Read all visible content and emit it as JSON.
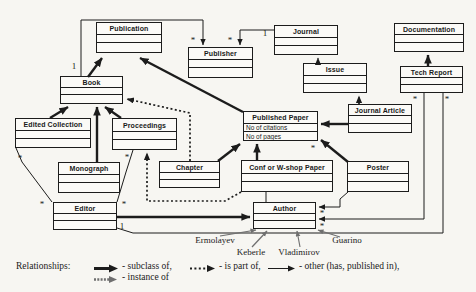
{
  "figure": {
    "colors": {
      "line": "#1c1c1c",
      "instance_line": "#6f6f6f",
      "background": "#f7f6f2",
      "box_fill": "#fbfaf7"
    },
    "nodes": [
      {
        "id": "publication",
        "label": "Publication",
        "x": 96,
        "y": 22,
        "w": 66,
        "h": 31,
        "attrs": [
          "",
          ""
        ]
      },
      {
        "id": "publisher",
        "label": "Publisher",
        "x": 188,
        "y": 47,
        "w": 65,
        "h": 31,
        "attrs": [
          "",
          ""
        ]
      },
      {
        "id": "journal",
        "label": "Journal",
        "x": 274,
        "y": 25,
        "w": 64,
        "h": 30,
        "attrs": [
          "",
          ""
        ]
      },
      {
        "id": "documentation",
        "label": "Documentation",
        "x": 394,
        "y": 23,
        "w": 70,
        "h": 29,
        "attrs": [
          "",
          ""
        ]
      },
      {
        "id": "book",
        "label": "Book",
        "x": 60,
        "y": 76,
        "w": 63,
        "h": 28,
        "attrs": [
          "",
          ""
        ]
      },
      {
        "id": "issue",
        "label": "Issue",
        "x": 303,
        "y": 63,
        "w": 64,
        "h": 30,
        "attrs": [
          "",
          ""
        ]
      },
      {
        "id": "tech-report",
        "label": "Tech Report",
        "x": 400,
        "y": 66,
        "w": 63,
        "h": 27,
        "attrs": [
          "",
          ""
        ]
      },
      {
        "id": "edited-collection",
        "label": "Edited Collection",
        "x": 15,
        "y": 118,
        "w": 76,
        "h": 30,
        "attrs": [
          "",
          ""
        ]
      },
      {
        "id": "proceedings",
        "label": "Proceedings",
        "x": 112,
        "y": 118,
        "w": 65,
        "h": 32,
        "attrs": [
          "",
          ""
        ]
      },
      {
        "id": "published-paper",
        "label": "Published Paper",
        "x": 243,
        "y": 111,
        "w": 75,
        "h": 30,
        "attrs": [
          "No of citations",
          "No of pages"
        ]
      },
      {
        "id": "journal-article",
        "label": "Journal Article",
        "x": 348,
        "y": 104,
        "w": 64,
        "h": 29,
        "attrs": [
          "",
          ""
        ]
      },
      {
        "id": "monograph",
        "label": "Monograph",
        "x": 58,
        "y": 162,
        "w": 62,
        "h": 31,
        "attrs": [
          "",
          ""
        ]
      },
      {
        "id": "chapter",
        "label": "Chapter",
        "x": 159,
        "y": 161,
        "w": 61,
        "h": 27,
        "attrs": [
          "",
          ""
        ]
      },
      {
        "id": "conf-paper",
        "label": "Conf or W-shop Paper",
        "x": 241,
        "y": 160,
        "w": 92,
        "h": 32,
        "attrs": [
          "",
          ""
        ]
      },
      {
        "id": "poster",
        "label": "Poster",
        "x": 347,
        "y": 161,
        "w": 62,
        "h": 31,
        "attrs": [
          "",
          ""
        ]
      },
      {
        "id": "editor",
        "label": "Editor",
        "x": 53,
        "y": 202,
        "w": 64,
        "h": 28,
        "attrs": [
          "",
          ""
        ]
      },
      {
        "id": "author",
        "label": "Author",
        "x": 253,
        "y": 202,
        "w": 63,
        "h": 27,
        "attrs": [
          "",
          ""
        ]
      }
    ],
    "edges": [
      {
        "name": "book-subclass-of-publication",
        "type": "subclass",
        "points": [
          [
            88,
            77
          ],
          [
            102,
            58
          ]
        ]
      },
      {
        "name": "published-paper-subclass-of-publication",
        "type": "subclass",
        "points": [
          [
            243,
            112
          ],
          [
            140,
            58
          ]
        ]
      },
      {
        "name": "edited-collection-subclass-of-book",
        "type": "subclass",
        "points": [
          [
            50,
            118
          ],
          [
            68,
            107
          ]
        ]
      },
      {
        "name": "proceedings-subclass-of-book",
        "type": "subclass",
        "points": [
          [
            121,
            118
          ],
          [
            105,
            107
          ]
        ]
      },
      {
        "name": "monograph-subclass-of-book",
        "type": "subclass",
        "points": [
          [
            97,
            162
          ],
          [
            97,
            107
          ]
        ]
      },
      {
        "name": "chapter-subclass-of-published-paper",
        "type": "subclass",
        "points": [
          [
            218,
            161
          ],
          [
            240,
            144
          ]
        ]
      },
      {
        "name": "conf-paper-subclass-of-published-paper",
        "type": "subclass",
        "points": [
          [
            257,
            160
          ],
          [
            257,
            144
          ]
        ]
      },
      {
        "name": "poster-subclass-of-published-paper",
        "type": "subclass",
        "points": [
          [
            348,
            162
          ],
          [
            321,
            140
          ]
        ]
      },
      {
        "name": "journal-article-subclass-of-published-paper",
        "type": "subclass",
        "points": [
          [
            348,
            124
          ],
          [
            321,
            124
          ]
        ]
      },
      {
        "name": "tech-report-subclass-of-documentation",
        "type": "subclass",
        "points": [
          [
            428,
            66
          ],
          [
            428,
            55
          ]
        ]
      },
      {
        "name": "editor-subclass-of-author",
        "type": "subclass",
        "points": [
          [
            117,
            217
          ],
          [
            250,
            217
          ]
        ]
      },
      {
        "name": "issue-part-of-journal",
        "type": "partof",
        "points": [
          [
            318,
            63
          ],
          [
            318,
            58
          ]
        ]
      },
      {
        "name": "journal-article-part-of-issue",
        "type": "partof",
        "points": [
          [
            359,
            104
          ],
          [
            359,
            96
          ]
        ]
      },
      {
        "name": "chapter-part-of-book",
        "type": "partof",
        "points": [
          [
            190,
            161
          ],
          [
            190,
            113
          ],
          [
            127,
            99
          ]
        ]
      },
      {
        "name": "conf-paper-part-of-proceedings",
        "type": "partof",
        "points": [
          [
            241,
            192
          ],
          [
            225,
            201
          ],
          [
            147,
            201
          ],
          [
            147,
            153
          ]
        ]
      },
      {
        "name": "book-publisher-association",
        "type": "other",
        "points": [
          [
            81,
            76
          ],
          [
            81,
            20
          ],
          [
            203,
            20
          ],
          [
            203,
            45
          ]
        ]
      },
      {
        "name": "journal-publisher-association",
        "type": "other",
        "points": [
          [
            274,
            30
          ],
          [
            240,
            30
          ],
          [
            240,
            45
          ]
        ]
      },
      {
        "name": "poster-author-association",
        "type": "other",
        "points": [
          [
            348,
            192
          ],
          [
            340,
            199
          ],
          [
            340,
            207
          ],
          [
            319,
            207
          ]
        ]
      },
      {
        "name": "tech-report-author-association",
        "type": "other",
        "points": [
          [
            424,
            93
          ],
          [
            424,
            219
          ],
          [
            319,
            219
          ]
        ]
      },
      {
        "name": "tech-report-editor-association",
        "type": "plain",
        "points": [
          [
            117,
            228
          ],
          [
            133,
            233
          ],
          [
            443,
            233
          ],
          [
            443,
            93
          ]
        ]
      },
      {
        "name": "conf-paper-author-association",
        "type": "plain",
        "points": [
          [
            266,
            192
          ],
          [
            266,
            202
          ]
        ]
      },
      {
        "name": "edited-collection-editor-association",
        "type": "plain",
        "points": [
          [
            16,
            148
          ],
          [
            22,
            162
          ],
          [
            52,
            202
          ]
        ]
      },
      {
        "name": "proceedings-editor-association",
        "type": "plain",
        "points": [
          [
            133,
            150
          ],
          [
            126,
            172
          ],
          [
            117,
            202
          ]
        ]
      },
      {
        "name": "ermolayev-instance-of-author",
        "type": "instance",
        "points": [
          [
            220,
            236
          ],
          [
            256,
            230
          ]
        ]
      },
      {
        "name": "keberle-instance-of-author",
        "type": "instance",
        "points": [
          [
            252,
            247
          ],
          [
            267,
            231
          ]
        ]
      },
      {
        "name": "vladimirov-instance-of-author",
        "type": "instance",
        "points": [
          [
            300,
            247
          ],
          [
            297,
            231
          ]
        ]
      },
      {
        "name": "guarino-instance-of-author",
        "type": "instance",
        "points": [
          [
            340,
            237
          ],
          [
            318,
            230
          ]
        ]
      }
    ],
    "multiplicities": [
      {
        "text": "1",
        "x": 74,
        "y": 66
      },
      {
        "text": "*",
        "x": 193,
        "y": 40
      },
      {
        "text": "*",
        "x": 230,
        "y": 40
      },
      {
        "text": "1",
        "x": 265,
        "y": 33
      },
      {
        "text": "*",
        "x": 415,
        "y": 99
      },
      {
        "text": "*",
        "x": 447,
        "y": 99
      },
      {
        "text": "*",
        "x": 313,
        "y": 148
      },
      {
        "text": "*",
        "x": 20,
        "y": 158
      },
      {
        "text": "*",
        "x": 127,
        "y": 157
      },
      {
        "text": "*",
        "x": 42,
        "y": 204
      },
      {
        "text": "*",
        "x": 124,
        "y": 204
      },
      {
        "text": "*",
        "x": 322,
        "y": 213
      },
      {
        "text": "*",
        "x": 322,
        "y": 226
      },
      {
        "text": "1",
        "x": 122,
        "y": 226
      }
    ],
    "instances": [
      {
        "label": "Ermolayev",
        "x": 215,
        "y": 235
      },
      {
        "label": "Keberle",
        "x": 251,
        "y": 247
      },
      {
        "label": "Vladimirov",
        "x": 299,
        "y": 247
      },
      {
        "label": "Guarino",
        "x": 347,
        "y": 235
      }
    ],
    "legend": {
      "title": "Relationships:",
      "items": [
        {
          "arrow": "subclass",
          "text": "- subclass of,"
        },
        {
          "arrow": "partof",
          "text": "- is part of,"
        },
        {
          "arrow": "other",
          "text": "- other (has, published in),"
        },
        {
          "arrow": "instance",
          "text": "- instance of"
        }
      ]
    }
  }
}
